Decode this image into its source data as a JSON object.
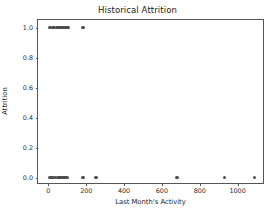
{
  "chart_data": {
    "type": "scatter",
    "title": "Historical Attrition",
    "xlabel": "Last Month's Activity",
    "ylabel": "Attrition",
    "xlim": [
      -55,
      1145
    ],
    "ylim": [
      -0.05,
      1.05
    ],
    "grid": false,
    "legend": null,
    "marker": {
      "shape": "circle",
      "color": "#4d4d4d",
      "size_px": 3.6
    },
    "xticks": [
      0,
      200,
      400,
      600,
      800,
      1000
    ],
    "xticklabels": [
      "0",
      "200",
      "400",
      "600",
      "800",
      "1000"
    ],
    "yticks": [
      0.0,
      0.2,
      0.4,
      0.6,
      0.8,
      1.0
    ],
    "yticklabels": [
      "0.0",
      "0.2",
      "0.4",
      "0.6",
      "0.8",
      "1.0"
    ],
    "series": [
      {
        "name": "Attrition observations",
        "x": [
          5,
          12,
          22,
          30,
          44,
          52,
          58,
          66,
          72,
          80,
          88,
          96,
          104,
          182,
          8,
          18,
          28,
          38,
          48,
          56,
          62,
          70,
          78,
          86,
          94,
          100,
          182,
          252,
          680,
          930,
          1090
        ],
        "y": [
          1,
          1,
          1,
          1,
          1,
          1,
          1,
          1,
          1,
          1,
          1,
          1,
          1,
          1,
          0,
          0,
          0,
          0,
          0,
          0,
          0,
          0,
          0,
          0,
          0,
          0,
          0,
          0,
          0,
          0,
          0
        ]
      }
    ],
    "points": [
      {
        "x": 5,
        "y": 1
      },
      {
        "x": 12,
        "y": 1
      },
      {
        "x": 22,
        "y": 1
      },
      {
        "x": 30,
        "y": 1
      },
      {
        "x": 44,
        "y": 1
      },
      {
        "x": 52,
        "y": 1
      },
      {
        "x": 58,
        "y": 1
      },
      {
        "x": 66,
        "y": 1
      },
      {
        "x": 72,
        "y": 1
      },
      {
        "x": 80,
        "y": 1
      },
      {
        "x": 88,
        "y": 1
      },
      {
        "x": 96,
        "y": 1
      },
      {
        "x": 104,
        "y": 1
      },
      {
        "x": 182,
        "y": 1
      },
      {
        "x": 8,
        "y": 0
      },
      {
        "x": 18,
        "y": 0
      },
      {
        "x": 28,
        "y": 0
      },
      {
        "x": 38,
        "y": 0
      },
      {
        "x": 48,
        "y": 0
      },
      {
        "x": 56,
        "y": 0
      },
      {
        "x": 62,
        "y": 0
      },
      {
        "x": 70,
        "y": 0
      },
      {
        "x": 78,
        "y": 0
      },
      {
        "x": 86,
        "y": 0
      },
      {
        "x": 94,
        "y": 0
      },
      {
        "x": 100,
        "y": 0
      },
      {
        "x": 182,
        "y": 0
      },
      {
        "x": 252,
        "y": 0
      },
      {
        "x": 680,
        "y": 0
      },
      {
        "x": 930,
        "y": 0
      },
      {
        "x": 1090,
        "y": 0
      }
    ]
  },
  "colors": {
    "marker": "#4d4d4d",
    "axis": "#555555",
    "text": "#1a1a1a",
    "background": "#ffffff"
  }
}
